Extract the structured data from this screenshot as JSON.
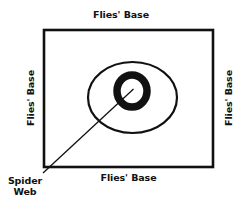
{
  "diagram": {
    "background_color": "#ffffff",
    "stroke_color": "#111111",
    "labels": {
      "top": "Flies' Base",
      "bottom": "Flies' Base",
      "left": "Flies' Base",
      "right": "Flies' Base",
      "callout_line1": "Spider",
      "callout_line2": "Web"
    },
    "shapes": {
      "rectangle": {
        "name": "flies-base-boundary",
        "x": 44,
        "y": 30,
        "width": 169,
        "height": 137,
        "stroke_width": 2.6,
        "fill": "none"
      },
      "outer_ellipse": {
        "name": "spider-web-outer-ring",
        "cx": 132.5,
        "cy": 97.5,
        "rx": 44.5,
        "ry": 35.5,
        "stroke_width": 2.2,
        "fill": "none"
      },
      "inner_ring": {
        "name": "spider-web-hub",
        "cx": 132,
        "cy": 91,
        "rx": 15,
        "ry": 16,
        "stroke_width": 7.5,
        "fill": "none"
      },
      "leader_line": {
        "name": "spider-web-leader",
        "x1": 43,
        "y1": 173,
        "x2": 133.5,
        "y2": 89,
        "stroke_width": 1.3
      }
    }
  }
}
